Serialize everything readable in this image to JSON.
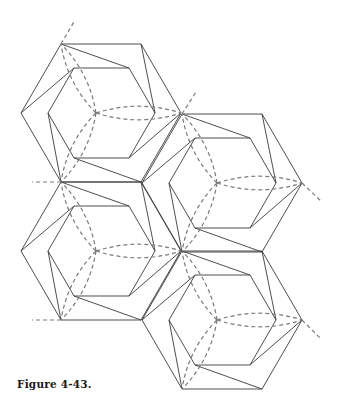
{
  "caption": "Figure 4-43.",
  "colors": {
    "line": "#3a3a3a",
    "dashed": "#7a7a7a",
    "background": "#ffffff"
  },
  "geometry": {
    "half_width": 80,
    "half_height": 69,
    "inner": {
      "top_x": [
        -27,
        28
      ],
      "top_y": -45,
      "side_x": [
        -53,
        54
      ]
    }
  },
  "hexagons": [
    {
      "id": "hex-top-left",
      "cx": 101,
      "cy": 113
    },
    {
      "id": "hex-mid-right",
      "cx": 222,
      "cy": 183
    },
    {
      "id": "hex-bottom-left",
      "cx": 101,
      "cy": 251
    },
    {
      "id": "hex-bottom-right",
      "cx": 222,
      "cy": 320
    }
  ],
  "extension_lines": [
    {
      "x1": 61,
      "y1": 44,
      "x2": 75,
      "y2": 20
    },
    {
      "x1": 182,
      "y1": 114,
      "x2": 196,
      "y2": 92
    },
    {
      "x1": 302,
      "y1": 183,
      "x2": 322,
      "y2": 202
    },
    {
      "x1": 61,
      "y1": 182,
      "x2": 32,
      "y2": 182
    },
    {
      "x1": 61,
      "y1": 320,
      "x2": 32,
      "y2": 320
    },
    {
      "x1": 302,
      "y1": 320,
      "x2": 321,
      "y2": 339
    }
  ]
}
